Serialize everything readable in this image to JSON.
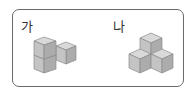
{
  "panels": [
    {
      "label": "가",
      "description": "L-shaped stack: two cubes stacked vertically on the left with one cube beside it on the right"
    },
    {
      "label": "나",
      "description": "Three cubes on the bottom arranged in an L with one cube on top"
    }
  ],
  "colors": {
    "border": "#6a6a6a",
    "cube_top": "#d9d9d9",
    "cube_left": "#c4c4c4",
    "cube_right": "#acacac",
    "edge": "#8a8a8a"
  }
}
